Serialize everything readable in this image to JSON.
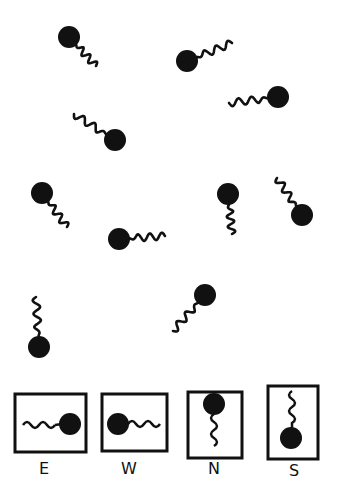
{
  "title": "",
  "ink_color": "#111111",
  "background": "#ffffff",
  "organisms": [
    {
      "id": 1,
      "head": [
        69,
        37
      ],
      "tail_end": [
        96,
        66
      ]
    },
    {
      "id": 2,
      "head": [
        187,
        61
      ],
      "tail_end": [
        232,
        43
      ]
    },
    {
      "id": 3,
      "head": [
        278,
        97
      ],
      "tail_end": [
        229,
        103
      ]
    },
    {
      "id": 4,
      "head": [
        115,
        140
      ],
      "tail_end": [
        74,
        114
      ]
    },
    {
      "id": 5,
      "head": [
        42,
        193
      ],
      "tail_end": [
        67,
        227
      ]
    },
    {
      "id": 6,
      "head": [
        119,
        239
      ],
      "tail_end": [
        165,
        236
      ]
    },
    {
      "id": 7,
      "head": [
        228,
        194
      ],
      "tail_end": [
        232,
        234
      ]
    },
    {
      "id": 8,
      "head": [
        302,
        215
      ],
      "tail_end": [
        277,
        178
      ]
    },
    {
      "id": 9,
      "head": [
        39,
        347
      ],
      "tail_end": [
        36,
        297
      ]
    },
    {
      "id": 10,
      "head": [
        205,
        295
      ],
      "tail_end": [
        173,
        331
      ]
    }
  ],
  "legend": [
    {
      "label": "E",
      "direction": "east"
    },
    {
      "label": "W",
      "direction": "west"
    },
    {
      "label": "N",
      "direction": "north"
    },
    {
      "label": "S",
      "direction": "south"
    }
  ]
}
